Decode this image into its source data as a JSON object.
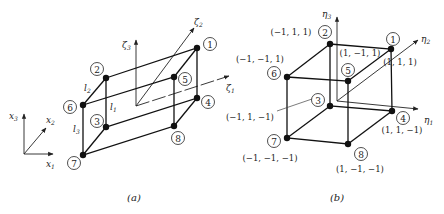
{
  "panel_a": {
    "caption": "(a)",
    "global_axes": {
      "x1": "x",
      "x1_sub": "1",
      "x2": "x",
      "x2_sub": "2",
      "x3": "x",
      "x3_sub": "3"
    },
    "local_axes": {
      "z1": "ζ",
      "z1_sub": "1",
      "z2": "ζ",
      "z2_sub": "2",
      "z3": "ζ",
      "z3_sub": "3"
    },
    "lengths": {
      "l1": "l",
      "l1_sub": "1",
      "l2": "l",
      "l2_sub": "2",
      "l3": "l",
      "l3_sub": "3"
    },
    "nodes": [
      "1",
      "2",
      "3",
      "4",
      "5",
      "6",
      "7",
      "8"
    ]
  },
  "panel_b": {
    "caption": "(b)",
    "axes": {
      "e1": "η",
      "e1_sub": "1",
      "e2": "η",
      "e2_sub": "2",
      "e3": "η",
      "e3_sub": "3"
    },
    "nodes": [
      "1",
      "2",
      "3",
      "4",
      "5",
      "6",
      "7",
      "8"
    ],
    "coords": {
      "n1": "(1, 1, 1)",
      "n2": "(−1, 1, 1)",
      "n3": "(−1, 1, −1)",
      "n4": "(1, 1, −1)",
      "n5": "(1, −1, 1)",
      "n6": "(−1, −1, 1)",
      "n7": "(−1, −1, −1)",
      "n8": "(1, −1, −1)"
    }
  }
}
